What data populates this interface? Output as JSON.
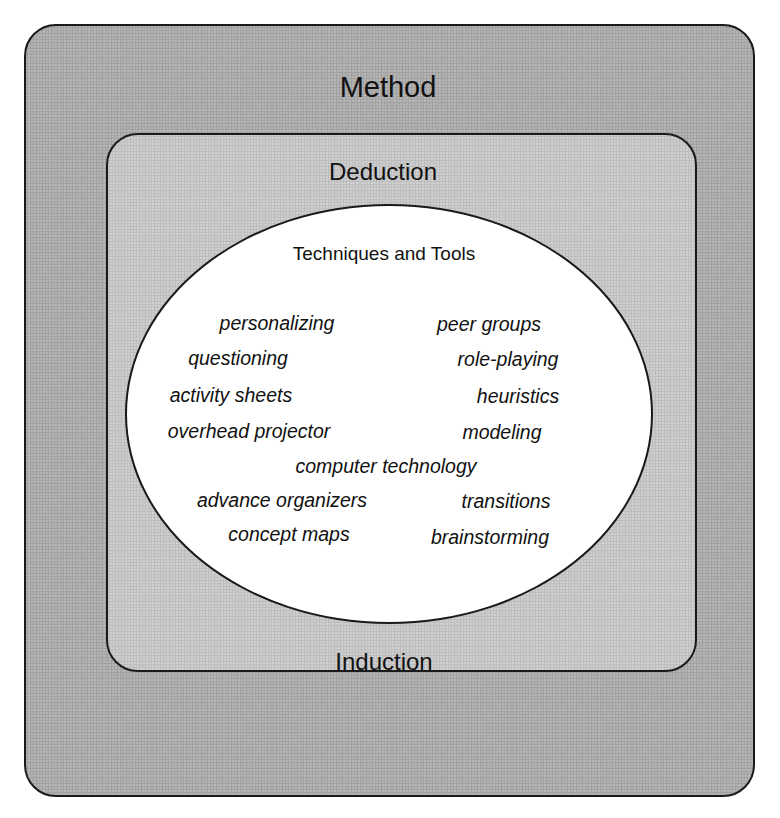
{
  "diagram": {
    "outer": {
      "label": "Method",
      "fill": "#b3b3b3"
    },
    "middle": {
      "top_label": "Deduction",
      "bottom_label": "Induction",
      "fill": "#cdcdcd"
    },
    "center": {
      "title": "Techniques and Tools",
      "fill": "#ffffff",
      "items": [
        {
          "text": "personalizing",
          "x": 277,
          "y": 314
        },
        {
          "text": "peer groups",
          "x": 489,
          "y": 315
        },
        {
          "text": "questioning",
          "x": 238,
          "y": 349
        },
        {
          "text": "role-playing",
          "x": 508,
          "y": 350
        },
        {
          "text": "activity sheets",
          "x": 231,
          "y": 386
        },
        {
          "text": "heuristics",
          "x": 518,
          "y": 387
        },
        {
          "text": "overhead projector",
          "x": 249,
          "y": 422
        },
        {
          "text": "modeling",
          "x": 502,
          "y": 423
        },
        {
          "text": "computer technology",
          "x": 386,
          "y": 457
        },
        {
          "text": "advance organizers",
          "x": 282,
          "y": 491
        },
        {
          "text": "transitions",
          "x": 506,
          "y": 492
        },
        {
          "text": "concept maps",
          "x": 289,
          "y": 525
        },
        {
          "text": "brainstorming",
          "x": 490,
          "y": 528
        }
      ]
    }
  }
}
